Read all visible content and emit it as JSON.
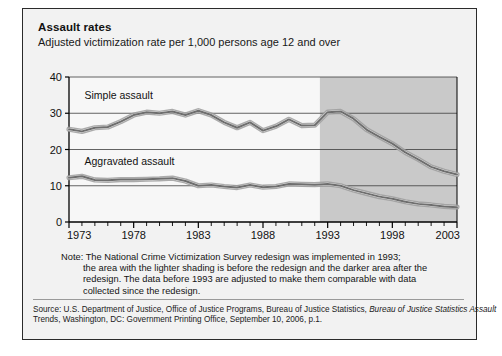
{
  "figure": {
    "title": "Assault rates",
    "subtitle": "Adjusted victimization rate per 1,000 persons age 12 and over",
    "note_label": "Note:",
    "note_lines": [
      "Note: The National Crime Victimization Survey redesign was implemented in 1993;",
      "the area with the lighter shading is before the redesign and the darker area after the",
      "redesign. The data before 1993 are adjusted to make them comparable with data",
      "collected since the redesign."
    ],
    "source_lines": [
      "Source: U.S. Department of Justice, Office of Justice Programs, Bureau of Justice Statistics, ",
      "Trends, Washington, DC: Government Printing Office, September 10, 2006, p.1."
    ],
    "source_italic": "Bureau of Justice Statistics Assault"
  },
  "colors": {
    "panel_background": "#f2f2f2",
    "plot_background_light": "#f7f7f7",
    "plot_background_dark": "#c9c9c9",
    "line_color": "#6e6e6e",
    "line_highlight": "#ffffff",
    "axis_color": "#000000",
    "gridline_color": "#3c3c3c",
    "frame_color": "#2b2b2b"
  },
  "chart_data": {
    "type": "line",
    "title": "Assault rates",
    "subtitle": "Adjusted victimization rate per 1,000 persons age 12 and over",
    "xlabel": "",
    "ylabel": "Adjusted victimization rate per 1,000 persons age 12 and over",
    "xlim": [
      1973,
      2003
    ],
    "ylim": [
      0,
      40
    ],
    "yticks": [
      0,
      10,
      20,
      30,
      40
    ],
    "ytick_labels": [
      "0",
      "10",
      "20",
      "30",
      "40"
    ],
    "xticks": [
      1973,
      1978,
      1983,
      1988,
      1993,
      1998,
      2003
    ],
    "xtick_labels": [
      "1973",
      "1978",
      "1983",
      "1988",
      "1993",
      "1998",
      "2003"
    ],
    "minor_xticks_every": 1,
    "grid": "horizontal",
    "legend": "inline-labels",
    "shaded_region": {
      "label": "post-redesign (darker)",
      "x_start": 1992.4,
      "x_end": 2003,
      "color": "#c9c9c9"
    },
    "x": [
      1973,
      1974,
      1975,
      1976,
      1977,
      1978,
      1979,
      1980,
      1981,
      1982,
      1983,
      1984,
      1985,
      1986,
      1987,
      1988,
      1989,
      1990,
      1991,
      1992,
      1993,
      1994,
      1995,
      1996,
      1997,
      1998,
      1999,
      2000,
      2001,
      2002,
      2003
    ],
    "series": [
      {
        "name": "Simple assault",
        "values": [
          25.6,
          25.0,
          26.0,
          26.2,
          27.7,
          29.5,
          30.3,
          30.0,
          30.5,
          29.5,
          30.7,
          29.5,
          27.5,
          26.0,
          27.5,
          25.2,
          26.4,
          28.3,
          26.6,
          26.7,
          30.3,
          30.5,
          28.5,
          25.5,
          23.5,
          21.6,
          19.2,
          17.3,
          15.2,
          14.0,
          13.1
        ]
      },
      {
        "name": "Aggravated assault",
        "values": [
          12.2,
          12.6,
          11.6,
          11.5,
          11.7,
          11.7,
          11.8,
          11.9,
          12.1,
          11.3,
          10.0,
          10.2,
          9.8,
          9.5,
          10.2,
          9.6,
          9.8,
          10.5,
          10.4,
          10.3,
          10.5,
          10.0,
          8.8,
          7.9,
          7.0,
          6.4,
          5.6,
          5.0,
          4.7,
          4.3,
          4.1
        ]
      }
    ],
    "annotations": [
      {
        "text": "Simple assault",
        "x": 1974.2,
        "y": 34.0
      },
      {
        "text": "Aggravated assault",
        "x": 1974.2,
        "y": 15.6
      }
    ]
  }
}
